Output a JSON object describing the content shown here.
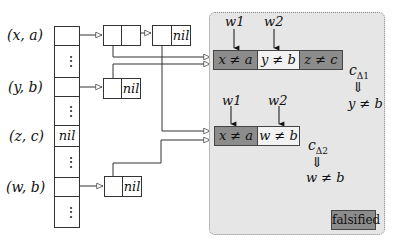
{
  "hash_table": {
    "rows": [
      {
        "key": "(x, a)",
        "content": "pointer",
        "top": 26,
        "height": 19
      },
      {
        "key": "",
        "content": "⋮",
        "top": 45,
        "height": 32
      },
      {
        "key": "(y, b)",
        "content": "pointer",
        "top": 77,
        "height": 19
      },
      {
        "key": "",
        "content": "⋮",
        "top": 96,
        "height": 29
      },
      {
        "key": "(z, c)",
        "content": "nil",
        "top": 125,
        "height": 21
      },
      {
        "key": "",
        "content": "⋮",
        "top": 146,
        "height": 31
      },
      {
        "key": "(w, b)",
        "content": "pointer",
        "top": 177,
        "height": 19
      },
      {
        "key": "",
        "content": "⋮",
        "top": 196,
        "height": 31
      }
    ],
    "labels": {
      "xa": "(x, a)",
      "yb": "(y, b)",
      "zc": "(z, c)",
      "wb": "(w, b)"
    },
    "nil_text": "nil",
    "dots": "⋮"
  },
  "lists": {
    "xa_node1_next": "",
    "xa_node2_next": "nil",
    "yb_node1_next": "nil",
    "wb_node1_next": "nil"
  },
  "clause_zone": {
    "background": "#e6e6e6",
    "clause1": {
      "literals": [
        "x ≠ a",
        "y ≠ b",
        "z ≠ c"
      ],
      "literal_states": [
        "falsified",
        "unassigned",
        "falsified"
      ],
      "watch_labels": [
        "w1",
        "w2"
      ],
      "name": "c",
      "name_sub": "Δ1",
      "implies": "⇓",
      "implied": "y ≠ b"
    },
    "clause2": {
      "literals": [
        "x ≠ a",
        "w ≠ b"
      ],
      "literal_states": [
        "falsified",
        "unassigned"
      ],
      "watch_labels": [
        "w1",
        "w2"
      ],
      "name": "c",
      "name_sub": "Δ2",
      "implies": "⇓",
      "implied": "w ≠ b"
    },
    "legend": {
      "label": "falsified",
      "color": "#8c8c8c"
    }
  },
  "colors": {
    "falsified": "#8c8c8c",
    "unassigned": "#f2f2f2",
    "line": "#333333"
  }
}
